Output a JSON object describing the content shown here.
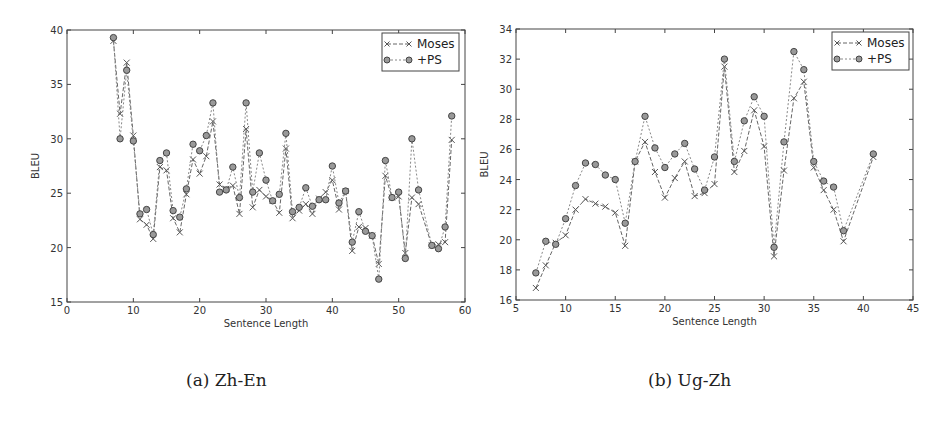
{
  "chart_data": [
    {
      "type": "line",
      "title": "",
      "caption": "(a) Zh-En",
      "xlabel": "Sentence Length",
      "ylabel": "BLEU",
      "xlim": [
        0,
        60
      ],
      "ylim": [
        15,
        40
      ],
      "xticks": [
        0,
        10,
        20,
        30,
        40,
        50,
        60
      ],
      "yticks": [
        15,
        20,
        25,
        30,
        35,
        40
      ],
      "grid": false,
      "legend_position": "upper right",
      "x": [
        7,
        8,
        9,
        10,
        11,
        12,
        13,
        14,
        15,
        16,
        17,
        18,
        19,
        20,
        21,
        22,
        23,
        24,
        25,
        26,
        27,
        28,
        29,
        30,
        31,
        32,
        33,
        34,
        35,
        36,
        37,
        38,
        39,
        40,
        41,
        42,
        43,
        44,
        45,
        46,
        47,
        48,
        49,
        50,
        51,
        52,
        53,
        55,
        56,
        57,
        58
      ],
      "series": [
        {
          "name": "Moses",
          "marker": "x",
          "values": [
            39.0,
            32.3,
            37.0,
            30.3,
            22.6,
            22.1,
            20.8,
            27.4,
            27.1,
            22.7,
            21.4,
            24.9,
            28.1,
            26.8,
            28.4,
            31.6,
            25.8,
            25.4,
            25.7,
            23.1,
            30.9,
            23.7,
            25.3,
            24.7,
            24.3,
            23.2,
            29.1,
            22.7,
            23.4,
            24.0,
            23.1,
            24.5,
            25.1,
            26.2,
            23.5,
            25.2,
            19.7,
            21.9,
            21.8,
            21.1,
            18.5,
            26.6,
            24.6,
            24.7,
            19.5,
            24.6,
            24.0,
            20.2,
            20.3,
            20.5,
            29.9
          ]
        },
        {
          "name": "+PS",
          "marker": "o",
          "values": [
            39.3,
            30.0,
            36.3,
            29.8,
            23.1,
            23.5,
            21.2,
            28.0,
            28.7,
            23.4,
            22.8,
            25.4,
            29.5,
            28.9,
            30.3,
            33.3,
            25.1,
            25.3,
            27.4,
            24.6,
            33.3,
            25.1,
            28.7,
            26.2,
            24.3,
            24.9,
            30.5,
            23.3,
            23.7,
            25.5,
            23.8,
            24.4,
            24.4,
            27.5,
            24.1,
            25.2,
            20.5,
            23.3,
            21.5,
            21.1,
            17.1,
            28.0,
            24.6,
            25.1,
            19.0,
            30.0,
            25.3,
            20.2,
            19.9,
            21.9,
            32.1
          ]
        }
      ]
    },
    {
      "type": "line",
      "title": "",
      "caption": "(b) Ug-Zh",
      "xlabel": "Sentence Length",
      "ylabel": "BLEU",
      "xlim": [
        5,
        45
      ],
      "ylim": [
        16,
        34
      ],
      "xticks": [
        5,
        10,
        15,
        20,
        25,
        30,
        35,
        40,
        45
      ],
      "yticks": [
        16,
        18,
        20,
        22,
        24,
        26,
        28,
        30,
        32,
        34
      ],
      "grid": false,
      "legend_position": "upper right",
      "x": [
        7,
        8,
        9,
        10,
        11,
        12,
        13,
        14,
        15,
        16,
        17,
        18,
        19,
        20,
        21,
        22,
        23,
        24,
        25,
        26,
        27,
        28,
        29,
        30,
        31,
        32,
        33,
        34,
        35,
        36,
        37,
        38,
        41
      ],
      "series": [
        {
          "name": "Moses",
          "marker": "x",
          "values": [
            16.8,
            18.3,
            19.8,
            20.3,
            22.0,
            22.7,
            22.4,
            22.2,
            21.8,
            19.6,
            25.2,
            26.5,
            24.5,
            22.8,
            24.1,
            25.2,
            22.9,
            23.1,
            23.7,
            31.5,
            24.5,
            25.9,
            28.6,
            26.2,
            18.9,
            24.6,
            29.4,
            30.5,
            24.8,
            23.3,
            22.0,
            19.9,
            25.5
          ]
        },
        {
          "name": "+PS",
          "marker": "o",
          "values": [
            17.8,
            19.9,
            19.7,
            21.4,
            23.6,
            25.1,
            25.0,
            24.3,
            24.0,
            21.1,
            25.2,
            28.2,
            26.1,
            24.8,
            25.7,
            26.4,
            24.7,
            23.3,
            25.5,
            32.0,
            25.2,
            27.9,
            29.5,
            28.2,
            19.5,
            26.5,
            32.5,
            31.3,
            25.2,
            23.9,
            23.5,
            20.6,
            25.7
          ]
        }
      ]
    }
  ]
}
